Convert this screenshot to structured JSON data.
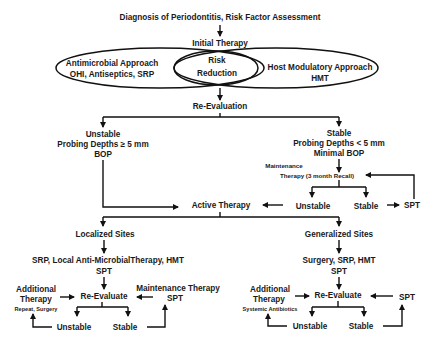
{
  "diagram": {
    "title": "Diagnosis of Periodontitis, Risk Factor Assessment",
    "initial_therapy": "Initial Therapy",
    "antimicrobial": {
      "line1": "Antimicrobial Approach",
      "line2": "OHI, Antiseptics, SRP"
    },
    "risk_reduction": {
      "line1": "Risk",
      "line2": "Reduction"
    },
    "host_modulatory": {
      "line1": "Host Modulatory Approach",
      "line2": "HMT"
    },
    "re_evaluation": "Re-Evaluation",
    "unstable_branch": {
      "line1": "Unstable",
      "line2": "Probing Depths ≥ 5 mm",
      "line3": "BOP"
    },
    "stable_branch": {
      "line1": "Stable",
      "line2": "Probing Depths < 5 mm",
      "line3": "Minimal BOP"
    },
    "maintenance": {
      "line1": "Maintenance",
      "line2": "Therapy (3 month Recall)"
    },
    "maint_unstable": "Unstable",
    "maint_stable": "Stable",
    "maint_spt": "SPT",
    "active_therapy": "Active Therapy",
    "localized": {
      "title": "Localized Sites",
      "treatment": "SRP, Local Anti-MicrobialTherapy, HMT",
      "spt": "SPT",
      "additional_line1": "Additional",
      "additional_line2": "Therapy",
      "additional_note": "Repeat, Surgery",
      "re_evaluate": "Re-Evaluate",
      "maintenance_line1": "Maintenance Therapy",
      "maintenance_line2": "SPT",
      "unstable": "Unstable",
      "stable": "Stable"
    },
    "generalized": {
      "title": "Generalized Sites",
      "treatment": "Surgery, SRP, HMT",
      "spt": "SPT",
      "additional_line1": "Additional",
      "additional_line2": "Therapy",
      "additional_note": "Systemic Antibiotics",
      "re_evaluate": "Re-Evaluate",
      "spt_right": "SPT",
      "unstable": "Unstable",
      "stable": "Stable"
    }
  }
}
